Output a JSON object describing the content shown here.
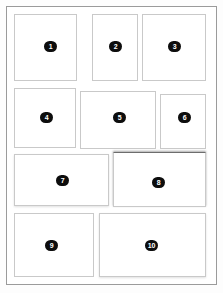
{
  "diagram": {
    "canvas": {
      "width": 223,
      "height": 293
    },
    "colors": {
      "page_background": "#ffffff",
      "canvas_background": "#fdfdfd",
      "frame_border": "#9b9b9b",
      "panel_border": "#c9c9c9",
      "panel_fill": "#ffffff",
      "badge_fill": "#0d0d0d",
      "badge_text": "#ffffff"
    },
    "frame": {
      "left": 6,
      "top": 6,
      "width": 211,
      "height": 279
    },
    "panels": [
      {
        "label": "1",
        "name": "panel-1",
        "left": 14,
        "top": 14,
        "width": 63,
        "height": 67,
        "badge_left": 44,
        "badge_top": 41,
        "shadow": "none"
      },
      {
        "label": "2",
        "name": "panel-2",
        "left": 92,
        "top": 14,
        "width": 46,
        "height": 67,
        "badge_left": 109,
        "badge_top": 41,
        "shadow": "none"
      },
      {
        "label": "3",
        "name": "panel-3",
        "left": 142,
        "top": 14,
        "width": 64,
        "height": 67,
        "badge_left": 168,
        "badge_top": 41,
        "shadow": "none"
      },
      {
        "label": "4",
        "name": "panel-4",
        "left": 14,
        "top": 88,
        "width": 62,
        "height": 60,
        "badge_left": 40,
        "badge_top": 112,
        "shadow": "none"
      },
      {
        "label": "5",
        "name": "panel-5",
        "left": 80,
        "top": 91,
        "width": 76,
        "height": 58,
        "badge_left": 113,
        "badge_top": 112,
        "shadow": "none"
      },
      {
        "label": "6",
        "name": "panel-6",
        "left": 160,
        "top": 94,
        "width": 46,
        "height": 55,
        "badge_left": 178,
        "badge_top": 112,
        "shadow": "none"
      },
      {
        "label": "7",
        "name": "panel-7",
        "left": 14,
        "top": 154,
        "width": 95,
        "height": 52,
        "badge_left": 56,
        "badge_top": 175,
        "shadow": "soft"
      },
      {
        "label": "8",
        "name": "panel-8",
        "left": 113,
        "top": 152,
        "width": 93,
        "height": 55,
        "badge_left": 152,
        "badge_top": 177,
        "shadow": "top"
      },
      {
        "label": "9",
        "name": "panel-9",
        "left": 14,
        "top": 213,
        "width": 80,
        "height": 64,
        "badge_left": 45,
        "badge_top": 240,
        "shadow": "none"
      },
      {
        "label": "10",
        "name": "panel-10",
        "left": 99,
        "top": 213,
        "width": 107,
        "height": 64,
        "badge_left": 145,
        "badge_top": 240,
        "shadow": "soft"
      }
    ]
  }
}
